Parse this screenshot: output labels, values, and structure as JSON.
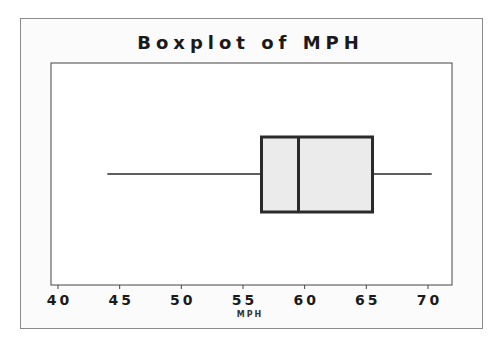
{
  "chart": {
    "title": "Boxplot of MPH",
    "xlabel": "MPH"
  },
  "colors": {
    "box_fill": "#ebebeb",
    "box_stroke": "#2a2a2a",
    "whisker": "#2a2a2a",
    "frame": "#8a8a8a",
    "plot_border": "#444444",
    "text": "#1a1a1a"
  },
  "chart_data": {
    "type": "boxplot",
    "title": "Boxplot of MPH",
    "xlabel": "MPH",
    "ylabel": "",
    "orientation": "horizontal",
    "xlim": [
      39.5,
      72
    ],
    "x_ticks": [
      40,
      45,
      50,
      55,
      60,
      65,
      70
    ],
    "x_tick_labels": [
      "40",
      "45",
      "50",
      "55",
      "60",
      "65",
      "70"
    ],
    "grid": false,
    "legend": null,
    "series": [
      {
        "name": "MPH",
        "min": 44.0,
        "q1": 56.5,
        "median": 59.5,
        "q3": 65.5,
        "max": 70.3,
        "outliers": []
      }
    ]
  }
}
